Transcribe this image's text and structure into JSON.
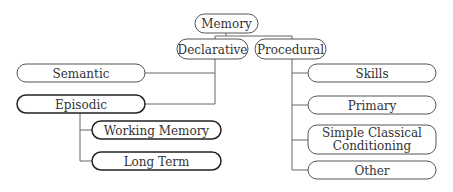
{
  "diagram": {
    "nodes": [
      {
        "id": "memory",
        "label": "Memory"
      },
      {
        "id": "declarative",
        "label": "Declarative"
      },
      {
        "id": "procedural",
        "label": "Procedural"
      },
      {
        "id": "semantic",
        "label": "Semantic"
      },
      {
        "id": "episodic",
        "label": "Episodic"
      },
      {
        "id": "working-memory",
        "label": "Working Memory"
      },
      {
        "id": "long-term",
        "label": "Long Term"
      },
      {
        "id": "skills",
        "label": "Skills"
      },
      {
        "id": "primary",
        "label": "Primary"
      },
      {
        "id": "simple-classical-conditioning",
        "label": "Simple Classical Conditioning",
        "lines": [
          "Simple Classical",
          "Conditioning"
        ]
      },
      {
        "id": "other",
        "label": "Other"
      }
    ],
    "edges": [
      {
        "from": "memory",
        "to": "declarative"
      },
      {
        "from": "memory",
        "to": "procedural"
      },
      {
        "from": "declarative",
        "to": "semantic"
      },
      {
        "from": "declarative",
        "to": "episodic"
      },
      {
        "from": "episodic",
        "to": "working-memory"
      },
      {
        "from": "episodic",
        "to": "long-term"
      },
      {
        "from": "procedural",
        "to": "skills"
      },
      {
        "from": "procedural",
        "to": "primary"
      },
      {
        "from": "procedural",
        "to": "simple-classical-conditioning"
      },
      {
        "from": "procedural",
        "to": "other"
      }
    ]
  }
}
